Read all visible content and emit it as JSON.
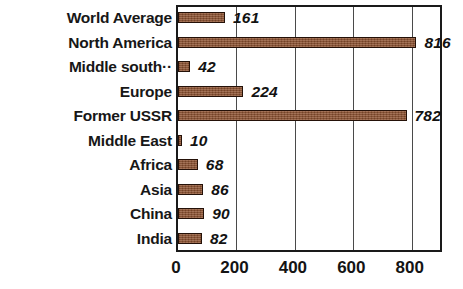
{
  "chart_data": {
    "type": "bar",
    "orientation": "horizontal",
    "title": "",
    "subtitle": "",
    "xlabel": "",
    "ylabel": "",
    "xlim": [
      0,
      900
    ],
    "ylim": null,
    "grid": "vertical-only",
    "legend": "none",
    "bar_color": "#8d512f",
    "bar_border_color": "#241108",
    "frame_color": "#1a1a1a",
    "gridline_color": "#4a4a4a",
    "text_color": "#141414",
    "value_label_style": "bold-italic",
    "xticks": [
      0,
      200,
      400,
      600,
      800
    ],
    "xtick_labels": [
      "0",
      "200",
      "400",
      "600",
      "800"
    ],
    "categories": [
      "World Average",
      "North America",
      "Middle south··",
      "Europe",
      "Former USSR",
      "Middle East",
      "Africa",
      "Asia",
      "China",
      "India"
    ],
    "values": [
      161,
      816,
      42,
      224,
      782,
      10,
      68,
      86,
      90,
      82
    ],
    "value_labels": [
      "161",
      "816",
      "42",
      "224",
      "782",
      "10",
      "68",
      "86",
      "90",
      "82"
    ],
    "bars": [
      {
        "category": "World Average",
        "value": 161,
        "label": "161"
      },
      {
        "category": "North America",
        "value": 816,
        "label": "816"
      },
      {
        "category": "Middle south··",
        "value": 42,
        "label": "42"
      },
      {
        "category": "Europe",
        "value": 224,
        "label": "224"
      },
      {
        "category": "Former USSR",
        "value": 782,
        "label": "782"
      },
      {
        "category": "Middle East",
        "value": 10,
        "label": "10"
      },
      {
        "category": "Africa",
        "value": 68,
        "label": "68"
      },
      {
        "category": "Asia",
        "value": 86,
        "label": "86"
      },
      {
        "category": "China",
        "value": 90,
        "label": "90"
      },
      {
        "category": "India",
        "value": 82,
        "label": "82"
      }
    ]
  }
}
